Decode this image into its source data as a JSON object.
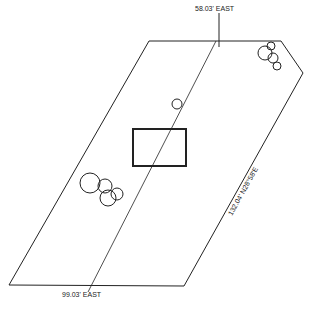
{
  "diagram": {
    "type": "site-plan",
    "colors": {
      "line": "#222222",
      "background": "#ffffff"
    },
    "labels": {
      "top_boundary": "58.03' EAST",
      "bottom_boundary": "99.03' EAST",
      "right_boundary": "132.04' N28°58'E"
    },
    "parcel": {
      "points": [
        [
          149,
          41
        ],
        [
          281,
          41
        ],
        [
          303,
          73
        ],
        [
          184,
          286
        ],
        [
          9,
          285
        ]
      ]
    },
    "center_line": {
      "from": [
        216,
        41
      ],
      "to": [
        88,
        292
      ]
    },
    "tick_mark": {
      "x": 219,
      "y1": 13,
      "y2": 47
    },
    "building": {
      "x": 133,
      "y": 129,
      "width": 53,
      "height": 37
    },
    "trees": [
      {
        "cx": 265,
        "cy": 53,
        "r": 7
      },
      {
        "cx": 271,
        "cy": 46,
        "r": 4
      },
      {
        "cx": 273,
        "cy": 58,
        "r": 5
      },
      {
        "cx": 277,
        "cy": 66,
        "r": 4
      },
      {
        "cx": 177,
        "cy": 104,
        "r": 5
      },
      {
        "cx": 90,
        "cy": 183,
        "r": 10
      },
      {
        "cx": 105,
        "cy": 186,
        "r": 7
      },
      {
        "cx": 108,
        "cy": 198,
        "r": 8
      },
      {
        "cx": 117,
        "cy": 194,
        "r": 6
      }
    ]
  }
}
